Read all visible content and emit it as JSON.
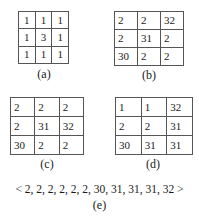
{
  "panels": [
    {
      "id": "a",
      "label": "(a)",
      "rows": [
        [
          "1",
          "1",
          "1"
        ],
        [
          "1",
          "3",
          "1"
        ],
        [
          "1",
          "1",
          "1"
        ]
      ]
    },
    {
      "id": "b",
      "label": "(b)",
      "rows": [
        [
          "2",
          "2",
          "32"
        ],
        [
          "2",
          "31",
          "2"
        ],
        [
          "30",
          "2",
          "2"
        ]
      ]
    },
    {
      "id": "c",
      "label": "(c)",
      "rows": [
        [
          "2",
          "2",
          "2"
        ],
        [
          "2",
          "31",
          "32"
        ],
        [
          "30",
          "2",
          "2"
        ]
      ]
    },
    {
      "id": "d",
      "label": "(d)",
      "rows": [
        [
          "1",
          "1",
          "32"
        ],
        [
          "2",
          "2",
          "31"
        ],
        [
          "30",
          "31",
          "31"
        ]
      ]
    }
  ],
  "sequence": {
    "text": "< 2, 2, 2, 2, 2, 2, 30, 31, 31, 31, 32 >",
    "label": "(e)"
  }
}
